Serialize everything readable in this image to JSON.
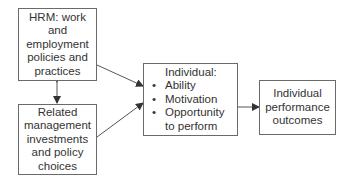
{
  "diagram": {
    "boxes": {
      "hrm": {
        "text": "HRM: work\nand\nemployment\npolicies and\npractices"
      },
      "management": {
        "text": "Related\nmanagement\ninvestments\nand policy\nchoices"
      },
      "individual": {
        "title": "Individual:",
        "items": [
          "Ability",
          "Motivation",
          "Opportunity\nto perform"
        ]
      },
      "outcomes": {
        "text": "Individual\nperformance\noutcomes"
      }
    },
    "connectors": [
      {
        "from": "hrm",
        "to": "management",
        "type": "bidirectional-arrow"
      },
      {
        "from": "hrm",
        "to": "individual",
        "type": "arrow"
      },
      {
        "from": "management",
        "to": "individual",
        "type": "arrow"
      },
      {
        "from": "individual",
        "to": "outcomes",
        "type": "arrow"
      }
    ],
    "colors": {
      "line": "#555555",
      "border": "#6a6a6a",
      "text": "#333333"
    }
  }
}
